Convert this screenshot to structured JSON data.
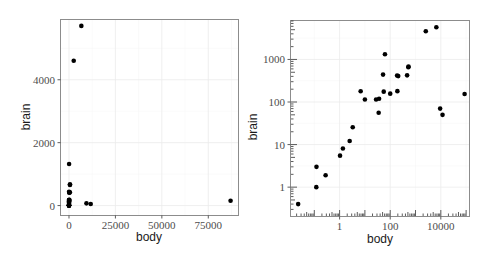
{
  "chart_data": [
    {
      "type": "scatter",
      "title": "",
      "xlabel": "body",
      "ylabel": "brain",
      "x_scale": "linear",
      "y_scale": "linear",
      "xlim": [
        -4300,
        91000
      ],
      "ylim": [
        -300,
        5900
      ],
      "x_ticks": [
        0,
        25000,
        50000,
        75000
      ],
      "x_tick_labels": [
        "0",
        "25000",
        "50000",
        "75000"
      ],
      "y_ticks": [
        0,
        2000,
        4000
      ],
      "y_tick_labels": [
        "0",
        "2000",
        "4000"
      ],
      "grid": true,
      "legend": null,
      "points": [
        {
          "x": 1.35,
          "y": 8.1
        },
        {
          "x": 465,
          "y": 423
        },
        {
          "x": 36.33,
          "y": 119.5
        },
        {
          "x": 27.66,
          "y": 115
        },
        {
          "x": 1.04,
          "y": 5.5
        },
        {
          "x": 11700,
          "y": 50
        },
        {
          "x": 2547,
          "y": 4603
        },
        {
          "x": 187.1,
          "y": 419
        },
        {
          "x": 521,
          "y": 655
        },
        {
          "x": 10,
          "y": 115
        },
        {
          "x": 3.3,
          "y": 25.6
        },
        {
          "x": 529,
          "y": 680
        },
        {
          "x": 207,
          "y": 406
        },
        {
          "x": 62,
          "y": 1320
        },
        {
          "x": 6654,
          "y": 5712
        },
        {
          "x": 9400,
          "y": 70
        },
        {
          "x": 6.8,
          "y": 179
        },
        {
          "x": 35,
          "y": 56
        },
        {
          "x": 0.12,
          "y": 1
        },
        {
          "x": 0.023,
          "y": 0.4
        },
        {
          "x": 2.5,
          "y": 12.1
        },
        {
          "x": 55.5,
          "y": 175
        },
        {
          "x": 100,
          "y": 157
        },
        {
          "x": 52.16,
          "y": 440
        },
        {
          "x": 0.28,
          "y": 1.9
        },
        {
          "x": 87000,
          "y": 154.5
        },
        {
          "x": 0.122,
          "y": 3
        },
        {
          "x": 192,
          "y": 180
        }
      ]
    },
    {
      "type": "scatter",
      "title": "",
      "xlabel": "body",
      "ylabel": "brain",
      "x_scale": "log10",
      "y_scale": "log10",
      "xlim": [
        0.012,
        130000
      ],
      "ylim": [
        0.21,
        8000
      ],
      "x_ticks": [
        1,
        100,
        10000
      ],
      "x_tick_labels": [
        "1",
        "100",
        "10000"
      ],
      "y_ticks": [
        1,
        10,
        100,
        1000
      ],
      "y_tick_labels": [
        "1",
        "10",
        "100",
        "1000"
      ],
      "grid": true,
      "annotation_logticks": true,
      "legend": null,
      "points_ref": "same data as panel 1"
    }
  ],
  "left_panel": {
    "xlabel": "body",
    "ylabel": "brain",
    "x_tick_labels": [
      "0",
      "25000",
      "50000",
      "75000"
    ],
    "y_tick_labels": [
      "0",
      "2000",
      "4000"
    ]
  },
  "right_panel": {
    "xlabel": "body",
    "ylabel": "brain",
    "x_tick_labels": [
      "1",
      "100",
      "10000"
    ],
    "y_tick_labels": [
      "1",
      "10",
      "100",
      "1000"
    ]
  },
  "colors": {
    "point": "#000000",
    "panel_border": "#8c8c8c",
    "grid": "#ebebeb",
    "tick_text": "#4d4d4d"
  }
}
